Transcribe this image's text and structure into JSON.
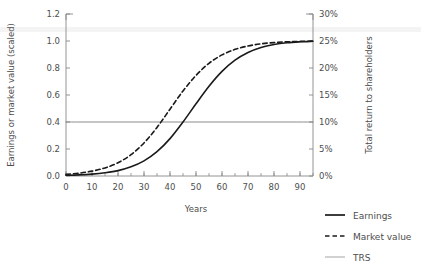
{
  "chart_data": {
    "type": "line",
    "title": "",
    "xlabel": "Years",
    "ylabel": "Earnings or market value (scaled)",
    "y2label": "Total return to shareholders",
    "xlim": [
      0,
      95
    ],
    "ylim": [
      0.0,
      1.2
    ],
    "y2lim": [
      0,
      30
    ],
    "grid": false,
    "legend_position": "bottom-right",
    "xticks": [
      0,
      10,
      20,
      30,
      40,
      50,
      60,
      70,
      80,
      90
    ],
    "xtick_labels": [
      "0",
      "10",
      "20",
      "30",
      "40",
      "50",
      "60",
      "70",
      "80",
      "90"
    ],
    "x_minor_tick_step": 5,
    "yticks": [
      0.0,
      0.2,
      0.4,
      0.6,
      0.8,
      1.0,
      1.2
    ],
    "ytick_labels": [
      "0.0",
      "0.2",
      "0.4",
      "0.6",
      "0.8",
      "1.0",
      "1.2"
    ],
    "y2ticks": [
      0,
      5,
      10,
      15,
      20,
      25,
      30
    ],
    "y2tick_labels": [
      "0%",
      "5%",
      "10%",
      "15%",
      "20%",
      "25%",
      "30%"
    ],
    "x": [
      0,
      5,
      10,
      15,
      20,
      25,
      30,
      35,
      40,
      45,
      50,
      55,
      60,
      65,
      70,
      75,
      80,
      85,
      90,
      95
    ],
    "series": [
      {
        "name": "Earnings",
        "style": "solid",
        "color": "#1a1a1a",
        "width": 1.6,
        "axis": "left",
        "values": [
          0.005,
          0.008,
          0.014,
          0.024,
          0.04,
          0.068,
          0.112,
          0.18,
          0.277,
          0.4,
          0.535,
          0.665,
          0.775,
          0.858,
          0.915,
          0.952,
          0.974,
          0.987,
          0.994,
          0.998
        ]
      },
      {
        "name": "Market value",
        "style": "dashed",
        "color": "#1a1a1a",
        "width": 1.6,
        "axis": "left",
        "values": [
          0.012,
          0.021,
          0.036,
          0.06,
          0.098,
          0.158,
          0.245,
          0.36,
          0.495,
          0.63,
          0.745,
          0.835,
          0.897,
          0.938,
          0.963,
          0.979,
          0.988,
          0.994,
          0.997,
          0.999
        ]
      },
      {
        "name": "TRS",
        "style": "solid",
        "color": "#808080",
        "width": 0.9,
        "axis": "left",
        "constant_value": 0.4,
        "right_axis_value": 10,
        "values": [
          0.4,
          0.4,
          0.4,
          0.4,
          0.4,
          0.4,
          0.4,
          0.4,
          0.4,
          0.4,
          0.4,
          0.4,
          0.4,
          0.4,
          0.4,
          0.4,
          0.4,
          0.4,
          0.4,
          0.4
        ]
      }
    ],
    "legend": [
      {
        "label": "Earnings",
        "style": "solid",
        "color": "#1a1a1a"
      },
      {
        "label": "Market value",
        "style": "dashed",
        "color": "#1a1a1a"
      },
      {
        "label": "TRS",
        "style": "solid",
        "color": "#999999"
      }
    ]
  }
}
